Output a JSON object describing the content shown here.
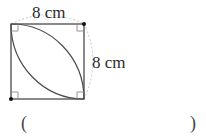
{
  "figure": {
    "shape": "square with two inscribed quarter-circle arcs forming a leaf/lens shape",
    "top_side_label": "8 cm",
    "right_side_label": "8 cm",
    "side_length_cm": 8,
    "right_angle_marks": 4,
    "arc_centers": [
      "top-right corner",
      "bottom-left corner"
    ],
    "colors": {
      "line": "#4a4a4a",
      "dashed_measure": "#c8c8c8",
      "dot": "#111111"
    }
  },
  "answer": {
    "open_paren": "(",
    "close_paren": ")",
    "blank": ""
  }
}
